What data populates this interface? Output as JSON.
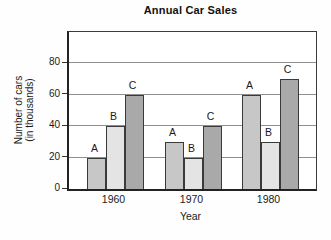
{
  "chart_data": {
    "type": "bar",
    "title": "Annual Car Sales",
    "xlabel": "Year",
    "ylabel": "Number of cars",
    "ylabel_line2": "(in thousands)",
    "categories": [
      "1960",
      "1970",
      "1980"
    ],
    "series": [
      {
        "name": "A",
        "color": "#c7c7c7",
        "values": [
          20,
          30,
          60
        ]
      },
      {
        "name": "B",
        "color": "#e4e4e4",
        "values": [
          40,
          20,
          30
        ]
      },
      {
        "name": "C",
        "color": "#a9a9a9",
        "values": [
          60,
          40,
          70
        ]
      }
    ],
    "ylim": [
      0,
      100
    ],
    "yticks": [
      0,
      20,
      40,
      60,
      80
    ],
    "grid": true,
    "bar_labels": true,
    "legend": "none",
    "colors": {
      "bar_border": "#3a3a3a",
      "gridline": "#8f8f8f",
      "axis": "#222222",
      "background": "#ffffff"
    }
  }
}
